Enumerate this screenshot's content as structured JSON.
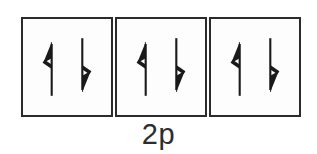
{
  "diagram": {
    "kind": "orbital-filling-diagram",
    "subshell_label": "2p",
    "box_count": 3,
    "electrons_per_box": 2,
    "stroke_color": "#2b2b2d",
    "box_fill_color": "#fdfdfd",
    "arrow_color": "#1a1a1a",
    "background_color": "#ffffff",
    "boxes": [
      {
        "name": "orbital-box-1",
        "electrons": [
          {
            "spin": "up",
            "arrow": "up-arrow",
            "barb_side": "left"
          },
          {
            "spin": "down",
            "arrow": "down-arrow",
            "barb_side": "right"
          }
        ]
      },
      {
        "name": "orbital-box-2",
        "electrons": [
          {
            "spin": "up",
            "arrow": "up-arrow",
            "barb_side": "left"
          },
          {
            "spin": "down",
            "arrow": "down-arrow",
            "barb_side": "right"
          }
        ]
      },
      {
        "name": "orbital-box-3",
        "electrons": [
          {
            "spin": "up",
            "arrow": "up-arrow",
            "barb_side": "left"
          },
          {
            "spin": "down",
            "arrow": "down-arrow",
            "barb_side": "right"
          }
        ]
      }
    ]
  }
}
